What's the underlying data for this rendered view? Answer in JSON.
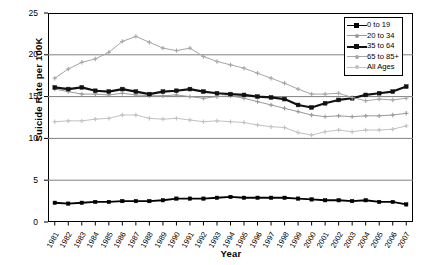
{
  "chart_data": {
    "type": "line",
    "title": "",
    "xlabel": "Year",
    "ylabel": "Suicide Rate per 100K",
    "xlim": [
      1981,
      2007
    ],
    "ylim": [
      0,
      25
    ],
    "ytick_labels": [
      "0",
      "5",
      "10",
      "15",
      "20",
      "25"
    ],
    "yticks": [
      0,
      5,
      10,
      15,
      20,
      25
    ],
    "grid": "horizontal",
    "legend_position": "top-right",
    "categories": [
      "1981",
      "1982",
      "1983",
      "1984",
      "1985",
      "1986",
      "1987",
      "1988",
      "1989",
      "1990",
      "1991",
      "1992",
      "1993",
      "1994",
      "1995",
      "1996",
      "1997",
      "1998",
      "1999",
      "2000",
      "2001",
      "2002",
      "2003",
      "2004",
      "2005",
      "2006",
      "2007"
    ],
    "x": [
      1981,
      1982,
      1983,
      1984,
      1985,
      1986,
      1987,
      1988,
      1989,
      1990,
      1991,
      1992,
      1993,
      1994,
      1995,
      1996,
      1997,
      1998,
      1999,
      2000,
      2001,
      2002,
      2003,
      2004,
      2005,
      2006,
      2007
    ],
    "series": [
      {
        "name": "0 to 19",
        "color": "#000000",
        "marker": "square",
        "width": 1.8,
        "values": [
          2.3,
          2.2,
          2.3,
          2.4,
          2.4,
          2.5,
          2.5,
          2.5,
          2.6,
          2.8,
          2.8,
          2.8,
          2.9,
          3.0,
          2.9,
          2.9,
          2.9,
          2.9,
          2.8,
          2.7,
          2.6,
          2.6,
          2.5,
          2.6,
          2.4,
          2.4,
          2.1
        ]
      },
      {
        "name": "20 to 34",
        "color": "#9a9a9a",
        "marker": "plus",
        "width": 1.0,
        "values": [
          15.9,
          15.6,
          15.3,
          15.3,
          15.2,
          15.4,
          15.2,
          15.1,
          15.1,
          15.2,
          15.0,
          14.8,
          15.0,
          15.1,
          14.8,
          14.4,
          14.0,
          13.6,
          13.2,
          12.8,
          12.6,
          12.7,
          12.6,
          12.7,
          12.7,
          12.8,
          13.0
        ]
      },
      {
        "name": "35 to 64",
        "color": "#111111",
        "marker": "square",
        "width": 2.2,
        "values": [
          16.1,
          15.9,
          16.1,
          15.7,
          15.6,
          15.9,
          15.6,
          15.3,
          15.6,
          15.7,
          15.9,
          15.6,
          15.4,
          15.3,
          15.2,
          15.0,
          14.9,
          14.7,
          14.0,
          13.7,
          14.2,
          14.6,
          14.8,
          15.2,
          15.4,
          15.6,
          16.2
        ]
      },
      {
        "name": "65 to 85+",
        "color": "#a6a6a6",
        "marker": "plus",
        "width": 1.0,
        "values": [
          17.2,
          18.3,
          19.1,
          19.5,
          20.3,
          21.6,
          22.2,
          21.5,
          20.8,
          20.5,
          20.8,
          19.8,
          19.2,
          18.8,
          18.4,
          17.8,
          17.2,
          16.6,
          15.9,
          15.3,
          15.3,
          15.4,
          14.9,
          14.5,
          14.7,
          14.6,
          14.8
        ]
      },
      {
        "name": "All Ages",
        "color": "#c2c2c2",
        "marker": "plus",
        "width": 1.0,
        "values": [
          12.0,
          12.1,
          12.1,
          12.3,
          12.4,
          12.8,
          12.8,
          12.4,
          12.3,
          12.4,
          12.2,
          12.0,
          12.1,
          12.0,
          11.9,
          11.6,
          11.4,
          11.3,
          10.7,
          10.4,
          10.8,
          11.0,
          10.8,
          11.0,
          11.0,
          11.1,
          11.5
        ]
      }
    ]
  },
  "legend": {
    "items": [
      {
        "label": "0 to 19"
      },
      {
        "label": "20 to 34"
      },
      {
        "label": "35 to 64"
      },
      {
        "label": "65 to 85+"
      },
      {
        "label": "All Ages"
      }
    ]
  }
}
